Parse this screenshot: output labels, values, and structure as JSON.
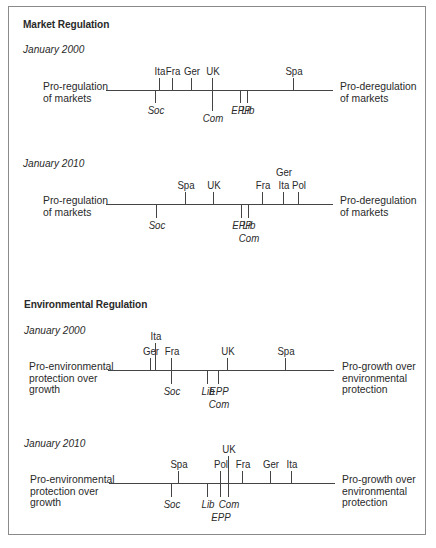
{
  "sections": [
    {
      "title": "Market Regulation",
      "left_label": "Pro-regulation\nof markets",
      "right_label": "Pro-deregulation\nof markets",
      "panels": [
        {
          "title": "January 2000",
          "axis_y": 90,
          "countries": [
            {
              "label": "Ita",
              "x": 159,
              "len": 12,
              "stack": 0
            },
            {
              "label": "Fra",
              "x": 172,
              "len": 12,
              "stack": 0
            },
            {
              "label": "Ger",
              "x": 191,
              "len": 12,
              "stack": 0
            },
            {
              "label": "UK",
              "x": 212,
              "len": 12,
              "stack": 0
            },
            {
              "label": "Spa",
              "x": 293,
              "len": 12,
              "stack": 0
            }
          ],
          "parties": [
            {
              "label": "Soc",
              "x": 155,
              "len": 13,
              "stack": 0
            },
            {
              "label": "Com",
              "x": 212,
              "len": 21,
              "stack": 0
            },
            {
              "label": "EPP",
              "x": 240,
              "len": 13,
              "stack": 0
            },
            {
              "label": "Lib",
              "x": 247,
              "len": 13,
              "stack": 0
            }
          ]
        },
        {
          "title": "January 2010",
          "axis_y": 204,
          "countries": [
            {
              "label": "Spa",
              "x": 185,
              "len": 12,
              "stack": 0
            },
            {
              "label": "UK",
              "x": 213,
              "len": 12,
              "stack": 0
            },
            {
              "label": "Fra",
              "x": 262,
              "len": 12,
              "stack": 0
            },
            {
              "label": "Ita",
              "x": 283,
              "len": 12,
              "stack": 0
            },
            {
              "label": "Ger",
              "x": 283,
              "len": 12,
              "stack": 1
            },
            {
              "label": "Pol",
              "x": 298,
              "len": 12,
              "stack": 0
            }
          ],
          "parties": [
            {
              "label": "Soc",
              "x": 156,
              "len": 14,
              "stack": 0
            },
            {
              "label": "EPP",
              "x": 241,
              "len": 14,
              "stack": 0
            },
            {
              "label": "Lib",
              "x": 248,
              "len": 14,
              "stack": 0
            },
            {
              "label": "Com",
              "x": 248,
              "len": 14,
              "stack": 1
            }
          ]
        }
      ]
    },
    {
      "title": "Environmental Regulation",
      "left_label": "Pro-environmental\nprotection over\ngrowth",
      "right_label": "Pro-growth over\nenvironmental\nprotection",
      "panels": [
        {
          "title": "January 2000",
          "axis_y": 370,
          "countries": [
            {
              "label": "Ger",
              "x": 150,
              "len": 12,
              "stack": 0
            },
            {
              "label": "Ita",
              "x": 155,
              "len": 27,
              "stack": 1
            },
            {
              "label": "Fra",
              "x": 171,
              "len": 12,
              "stack": 0
            },
            {
              "label": "UK",
              "x": 227,
              "len": 12,
              "stack": 0
            },
            {
              "label": "Spa",
              "x": 285,
              "len": 12,
              "stack": 0
            }
          ],
          "parties": [
            {
              "label": "Soc",
              "x": 171,
              "len": 14,
              "stack": 0
            },
            {
              "label": "Lib",
              "x": 207,
              "len": 14,
              "stack": 0
            },
            {
              "label": "EPP",
              "x": 218,
              "len": 14,
              "stack": 0
            },
            {
              "label": "Com",
              "x": 218,
              "len": 14,
              "stack": 1
            }
          ]
        },
        {
          "title": "January 2010",
          "axis_y": 483,
          "countries": [
            {
              "label": "Spa",
              "x": 178,
              "len": 12,
              "stack": 0
            },
            {
              "label": "Pol",
              "x": 220,
              "len": 12,
              "stack": 0
            },
            {
              "label": "UK",
              "x": 228,
              "len": 27,
              "stack": 1
            },
            {
              "label": "Fra",
              "x": 242,
              "len": 12,
              "stack": 0
            },
            {
              "label": "Ger",
              "x": 270,
              "len": 12,
              "stack": 0
            },
            {
              "label": "Ita",
              "x": 291,
              "len": 12,
              "stack": 0
            }
          ],
          "parties": [
            {
              "label": "Soc",
              "x": 171,
              "len": 14,
              "stack": 0
            },
            {
              "label": "Lib",
              "x": 207,
              "len": 14,
              "stack": 0
            },
            {
              "label": "Com",
              "x": 228,
              "len": 14,
              "stack": 0
            },
            {
              "label": "EPP",
              "x": 220,
              "len": 14,
              "stack": 1
            }
          ]
        }
      ]
    }
  ]
}
